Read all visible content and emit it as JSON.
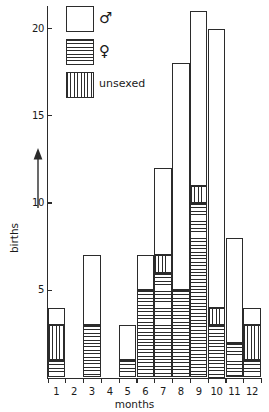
{
  "chart_data": {
    "type": "bar",
    "subtype": "stacked-histogram",
    "title": "",
    "xlabel": "months",
    "ylabel": "births",
    "categories": [
      "1",
      "2",
      "3",
      "4",
      "5",
      "6",
      "7",
      "8",
      "9",
      "10",
      "11",
      "12"
    ],
    "ylim": [
      0,
      21
    ],
    "yticks": [
      5,
      10,
      15,
      20
    ],
    "ytick_labels": [
      "5",
      "10",
      "15",
      "20"
    ],
    "grid": false,
    "legend_position": "top-left",
    "stack_order_bottom_to_top": [
      "female",
      "unsexed",
      "male"
    ],
    "series": [
      {
        "name": "♀",
        "key": "female",
        "fill": "horizontal-hatch",
        "values": [
          1,
          0,
          3,
          0,
          1,
          5,
          6,
          5,
          10,
          3,
          2,
          1
        ]
      },
      {
        "name": "unsexed",
        "key": "unsexed",
        "fill": "vertical-hatch",
        "values": [
          2,
          0,
          0,
          0,
          0,
          0,
          1,
          0,
          1,
          1,
          0,
          2
        ]
      },
      {
        "name": "♂",
        "key": "male",
        "fill": "empty",
        "values": [
          1,
          0,
          4,
          0,
          2,
          2,
          5,
          13,
          10,
          16,
          6,
          1
        ]
      }
    ],
    "totals": [
      4,
      0,
      7,
      0,
      3,
      7,
      12,
      18,
      21,
      20,
      8,
      4
    ]
  },
  "legend": {
    "items": [
      {
        "label": "♂",
        "swatch": "empty"
      },
      {
        "label": "♀",
        "swatch": "horizontal-hatch"
      },
      {
        "label": "unsexed",
        "swatch": "vertical-hatch"
      }
    ]
  },
  "axes": {
    "y_title": "births",
    "x_title": "months"
  },
  "colors": {
    "ink": "#2b2b2b",
    "paper": "#ffffff"
  }
}
